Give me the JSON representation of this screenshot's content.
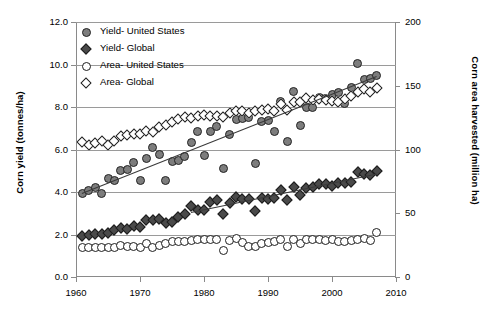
{
  "chart_data": {
    "type": "scatter",
    "title": "",
    "xlabel": "",
    "ylabel": "Corn yield (tonnes/ha)",
    "ylabel_right": "Corn area harvested (million ha)",
    "xlim": [
      1960,
      2010
    ],
    "ylim": [
      0.0,
      12.0
    ],
    "ylim_right": [
      0,
      200
    ],
    "xticks": [
      1960,
      1970,
      1980,
      1990,
      2000,
      2010
    ],
    "yticks": [
      "0.0",
      "2.0",
      "4.0",
      "6.0",
      "8.0",
      "10.0",
      "12.0"
    ],
    "yticks_right": [
      "0",
      "50",
      "100",
      "150",
      "200"
    ],
    "grid": "horizontal",
    "legend_position": "top-left",
    "legend": [
      {
        "label": "Yield- United States",
        "marker": "filled-circle",
        "color": "#7d7d7d"
      },
      {
        "label": "Yield- Global",
        "marker": "filled-diamond",
        "color": "#4a4a4a"
      },
      {
        "label": "Area- United States",
        "marker": "open-circle",
        "color": "#ffffff"
      },
      {
        "label": "Area- Global",
        "marker": "open-diamond",
        "color": "#ffffff"
      }
    ],
    "x": [
      1961,
      1962,
      1963,
      1964,
      1965,
      1966,
      1967,
      1968,
      1969,
      1970,
      1971,
      1972,
      1973,
      1974,
      1975,
      1976,
      1977,
      1978,
      1979,
      1980,
      1981,
      1982,
      1983,
      1984,
      1985,
      1986,
      1987,
      1988,
      1989,
      1990,
      1991,
      1992,
      1993,
      1994,
      1995,
      1996,
      1997,
      1998,
      1999,
      2000,
      2001,
      2002,
      2003,
      2004,
      2005,
      2006,
      2007
    ],
    "series": [
      {
        "name": "Yield- United States",
        "axis": "left",
        "unit": "tonnes/ha",
        "marker": "filled-circle",
        "values": [
          3.92,
          4.05,
          4.19,
          3.95,
          4.65,
          4.56,
          5.0,
          5.08,
          5.4,
          4.54,
          5.59,
          6.1,
          5.76,
          4.54,
          5.42,
          5.5,
          5.69,
          6.35,
          6.87,
          5.74,
          6.85,
          7.08,
          5.11,
          6.69,
          7.41,
          7.48,
          7.52,
          5.33,
          7.31,
          7.35,
          6.84,
          8.25,
          6.37,
          8.71,
          7.11,
          7.97,
          8.0,
          8.44,
          8.41,
          8.59,
          8.67,
          8.15,
          8.92,
          10.07,
          9.29,
          9.36,
          9.48
        ],
        "trend": {
          "x0": 1961,
          "y0": 3.95,
          "x1": 2007,
          "y1": 9.45
        }
      },
      {
        "name": "Yield- Global",
        "axis": "left",
        "unit": "tonnes/ha",
        "marker": "filled-diamond",
        "values": [
          1.94,
          2.0,
          2.04,
          2.02,
          2.06,
          2.21,
          2.32,
          2.28,
          2.42,
          2.36,
          2.66,
          2.69,
          2.74,
          2.53,
          2.59,
          2.82,
          2.97,
          3.36,
          3.15,
          3.15,
          3.54,
          3.61,
          2.98,
          3.5,
          3.77,
          3.68,
          3.67,
          3.12,
          3.72,
          3.69,
          3.72,
          4.1,
          3.64,
          4.25,
          3.84,
          4.18,
          4.22,
          4.38,
          4.36,
          4.27,
          4.44,
          4.43,
          4.46,
          4.95,
          4.84,
          4.81,
          5.01
        ],
        "trend": {
          "x0": 1978,
          "y0": 3.07,
          "x1": 2007,
          "y1": 4.88
        }
      },
      {
        "name": "Area- United States",
        "axis": "right",
        "unit": "million ha",
        "marker": "open-circle",
        "values": [
          23.2,
          23.0,
          23.5,
          23.3,
          23.2,
          23.3,
          24.6,
          23.7,
          23.7,
          23.2,
          25.9,
          22.9,
          25.0,
          26.5,
          27.5,
          28.0,
          28.2,
          28.6,
          29.2,
          29.5,
          29.5,
          29.3,
          20.9,
          28.7,
          30.4,
          27.3,
          24.1,
          23.9,
          26.1,
          27.1,
          27.9,
          29.2,
          24.0,
          29.5,
          26.4,
          29.2,
          29.4,
          29.4,
          28.6,
          29.3,
          27.8,
          28.1,
          28.7,
          29.8,
          30.4,
          28.6,
          35.0
        ]
      },
      {
        "name": "Area- Global",
        "axis": "right",
        "unit": "million ha",
        "marker": "open-diamond",
        "values": [
          105.5,
          103.8,
          104.9,
          106.7,
          103.9,
          106.3,
          110.8,
          111.7,
          112.3,
          112.5,
          114.8,
          113.5,
          117.9,
          119.2,
          121.8,
          124.3,
          125.3,
          124.8,
          125.9,
          127.0,
          126.5,
          126.2,
          125.6,
          129.0,
          130.3,
          130.2,
          128.4,
          130.0,
          131.3,
          131.4,
          130.3,
          135.8,
          131.2,
          137.4,
          137.5,
          140.4,
          138.5,
          139.5,
          139.0,
          138.4,
          137.5,
          139.5,
          142.1,
          145.0,
          147.4,
          144.8,
          148.0
        ]
      }
    ]
  },
  "caption": ""
}
